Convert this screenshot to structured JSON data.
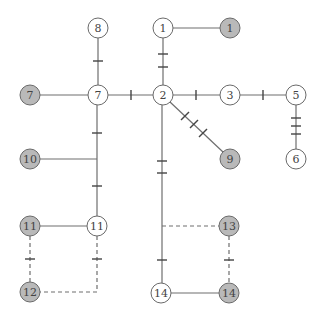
{
  "diagram": {
    "type": "network-graph",
    "colors": {
      "edge": "#6e6e6e",
      "white_node_fill": "#ffffff",
      "gray_node_fill": "#b9b9b9",
      "node_stroke": "#6a6a6a",
      "label": "#444444"
    },
    "nodes": [
      {
        "id": "w1",
        "label": "1",
        "kind": "white",
        "x": 163,
        "y": 28
      },
      {
        "id": "g1",
        "label": "1",
        "kind": "gray",
        "x": 230,
        "y": 28
      },
      {
        "id": "w8",
        "label": "8",
        "kind": "white",
        "x": 98,
        "y": 28
      },
      {
        "id": "g7",
        "label": "7",
        "kind": "gray",
        "x": 30,
        "y": 95
      },
      {
        "id": "w7",
        "label": "7",
        "kind": "white",
        "x": 98,
        "y": 95
      },
      {
        "id": "w2",
        "label": "2",
        "kind": "white",
        "x": 163,
        "y": 95
      },
      {
        "id": "w3",
        "label": "3",
        "kind": "white",
        "x": 230,
        "y": 95
      },
      {
        "id": "w5",
        "label": "5",
        "kind": "white",
        "x": 296,
        "y": 95
      },
      {
        "id": "g10",
        "label": "10",
        "kind": "gray",
        "x": 30,
        "y": 159
      },
      {
        "id": "g9",
        "label": "9",
        "kind": "gray",
        "x": 230,
        "y": 159
      },
      {
        "id": "w6",
        "label": "6",
        "kind": "white",
        "x": 296,
        "y": 159
      },
      {
        "id": "g11",
        "label": "11",
        "kind": "gray",
        "x": 30,
        "y": 226
      },
      {
        "id": "w11",
        "label": "11",
        "kind": "white",
        "x": 97,
        "y": 226
      },
      {
        "id": "g13",
        "label": "13",
        "kind": "gray",
        "x": 229,
        "y": 226
      },
      {
        "id": "g12",
        "label": "12",
        "kind": "gray",
        "x": 30,
        "y": 292
      },
      {
        "id": "w14",
        "label": "14",
        "kind": "white",
        "x": 161,
        "y": 293
      },
      {
        "id": "g14",
        "label": "14",
        "kind": "gray",
        "x": 229,
        "y": 293
      }
    ],
    "edges": [
      {
        "from": "w1",
        "to": "g1",
        "style": "solid",
        "ticks": 0
      },
      {
        "from": "w1",
        "to": "w2",
        "style": "solid",
        "ticks": 2
      },
      {
        "from": "w8",
        "to": "w7",
        "style": "solid",
        "ticks": 1
      },
      {
        "from": "g7",
        "to": "w7",
        "style": "solid",
        "ticks": 0
      },
      {
        "from": "w7",
        "to": "w2",
        "style": "solid",
        "ticks": 1
      },
      {
        "from": "w2",
        "to": "w3",
        "style": "solid",
        "ticks": 1
      },
      {
        "from": "w3",
        "to": "w5",
        "style": "solid",
        "ticks": 1
      },
      {
        "from": "w5",
        "to": "w6",
        "style": "solid",
        "ticks": 3
      },
      {
        "from": "w2",
        "to": "g9",
        "style": "solid",
        "ticks": 3
      },
      {
        "from": "w7",
        "to": "w11",
        "style": "solid",
        "ticks": 2
      },
      {
        "from": "g10",
        "to": "w7-w11 junction",
        "style": "solid",
        "ticks": 0
      },
      {
        "from": "g11",
        "to": "w11",
        "style": "solid",
        "ticks": 0
      },
      {
        "from": "g11",
        "to": "g12",
        "style": "dashed",
        "ticks": 1
      },
      {
        "from": "w11",
        "to": "g12",
        "style": "dashed",
        "ticks": 1
      },
      {
        "from": "w2",
        "to": "w14",
        "style": "solid",
        "ticks": 3
      },
      {
        "from": "w2-w14 junction",
        "to": "g13",
        "style": "dashed",
        "ticks": 0
      },
      {
        "from": "g13",
        "to": "g14",
        "style": "dashed",
        "ticks": 1
      },
      {
        "from": "w14",
        "to": "g14",
        "style": "solid",
        "ticks": 0
      }
    ]
  }
}
